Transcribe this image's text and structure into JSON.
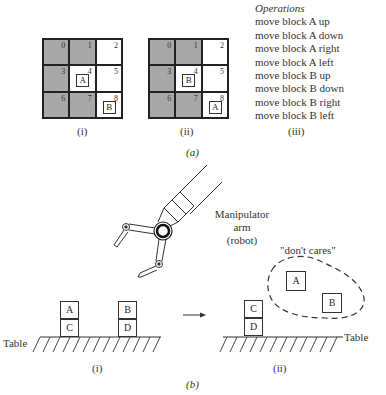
{
  "part_a": {
    "label": "(a)",
    "grids": [
      {
        "caption": "(i)",
        "cells": [
          {
            "num": "0",
            "shaded": true,
            "block": ""
          },
          {
            "num": "1",
            "shaded": true,
            "block": ""
          },
          {
            "num": "2",
            "shaded": false,
            "block": ""
          },
          {
            "num": "3",
            "shaded": true,
            "block": ""
          },
          {
            "num": "4",
            "shaded": false,
            "block": "A"
          },
          {
            "num": "5",
            "shaded": false,
            "block": ""
          },
          {
            "num": "6",
            "shaded": true,
            "block": ""
          },
          {
            "num": "7",
            "shaded": true,
            "block": ""
          },
          {
            "num": "8",
            "shaded": false,
            "block": "B"
          }
        ]
      },
      {
        "caption": "(ii)",
        "cells": [
          {
            "num": "0",
            "shaded": true,
            "block": ""
          },
          {
            "num": "1",
            "shaded": true,
            "block": ""
          },
          {
            "num": "2",
            "shaded": false,
            "block": ""
          },
          {
            "num": "3",
            "shaded": true,
            "block": ""
          },
          {
            "num": "4",
            "shaded": false,
            "block": "B"
          },
          {
            "num": "5",
            "shaded": false,
            "block": ""
          },
          {
            "num": "6",
            "shaded": true,
            "block": ""
          },
          {
            "num": "7",
            "shaded": true,
            "block": ""
          },
          {
            "num": "8",
            "shaded": false,
            "block": "A"
          }
        ]
      }
    ],
    "operations": {
      "caption": "(iii)",
      "title": "Operations",
      "items": [
        "move block A up",
        "move block A down",
        "move block A right",
        "move block A left",
        "move block B up",
        "move block B down",
        "move block B right",
        "move block B left"
      ]
    }
  },
  "part_b": {
    "label": "(b)",
    "robot_label": [
      "Manipulator",
      "arm",
      "(robot)"
    ],
    "dont_cares_label": "\"don't cares\"",
    "table_label": "Table",
    "scene_i": {
      "caption": "(i)",
      "stacks": [
        {
          "top": "A",
          "bottom": "C"
        },
        {
          "top": "B",
          "bottom": "D"
        }
      ]
    },
    "scene_ii": {
      "caption": "(ii)",
      "stack": {
        "top": "C",
        "bottom": "D"
      },
      "dont_care_blocks": [
        "A",
        "B"
      ]
    }
  },
  "colors": {
    "shaded_cell": "#a8a8a8",
    "line": "#222222"
  }
}
